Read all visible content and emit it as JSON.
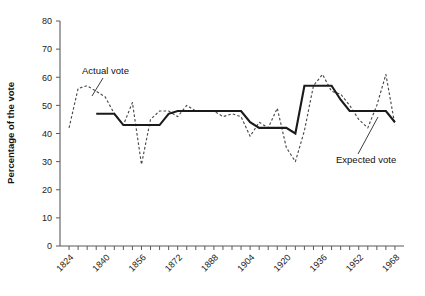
{
  "chart_data": {
    "type": "line",
    "title": "",
    "xlabel": "",
    "ylabel": "Percentage of the vote",
    "ylim": [
      0,
      80
    ],
    "ytick_step": 10,
    "yticks": [
      0,
      10,
      20,
      30,
      40,
      50,
      60,
      70,
      80
    ],
    "ytick_labels": [
      "0",
      "10",
      "20",
      "30",
      "40",
      "50",
      "60",
      "70",
      "80"
    ],
    "xlim": [
      1820,
      1972
    ],
    "xtick_step": 4,
    "xtick_labels": [
      "1824",
      "1840",
      "1856",
      "1872",
      "1888",
      "1904",
      "1920",
      "1936",
      "1952",
      "1968"
    ],
    "xtick_label_years": [
      1824,
      1840,
      1856,
      1872,
      1888,
      1904,
      1920,
      1936,
      1952,
      1968
    ],
    "grid": false,
    "legend_position": "inline-annotation",
    "annotations": [
      {
        "name": "actual-vote",
        "text": "Actual vote",
        "text_x": 82,
        "text_y": 74,
        "leader_from_x": 103,
        "leader_from_y": 78,
        "leader_to_x": 92,
        "leader_to_y": 96
      },
      {
        "name": "expected-vote",
        "text": "Expected vote",
        "text_x": 336,
        "text_y": 163,
        "leader_from_x": 358,
        "leader_from_y": 154,
        "leader_to_x": 378,
        "leader_to_y": 117
      }
    ],
    "series": [
      {
        "name": "Actual vote",
        "style": "dashed",
        "x": [
          1824,
          1828,
          1832,
          1836,
          1840,
          1844,
          1848,
          1852,
          1856,
          1860,
          1864,
          1868,
          1872,
          1876,
          1880,
          1884,
          1888,
          1892,
          1896,
          1900,
          1904,
          1908,
          1912,
          1916,
          1920,
          1924,
          1928,
          1932,
          1936,
          1940,
          1944,
          1948,
          1952,
          1956,
          1960,
          1964,
          1968
        ],
        "values": [
          42,
          56,
          57,
          55,
          53,
          47,
          43,
          51,
          29,
          45,
          48,
          48,
          46,
          50,
          48,
          48,
          48,
          46,
          47,
          46,
          39,
          44,
          42,
          49,
          35,
          30,
          41,
          57,
          61,
          55,
          54,
          50,
          45,
          42,
          50,
          61,
          43
        ]
      },
      {
        "name": "Expected vote",
        "style": "solid",
        "x": [
          1836,
          1840,
          1844,
          1848,
          1852,
          1856,
          1860,
          1864,
          1868,
          1872,
          1876,
          1880,
          1884,
          1888,
          1892,
          1896,
          1900,
          1904,
          1908,
          1912,
          1916,
          1920,
          1924,
          1928,
          1932,
          1936,
          1940,
          1944,
          1948,
          1952,
          1956,
          1960,
          1964,
          1968
        ],
        "values": [
          47,
          47,
          47,
          43,
          43,
          43,
          43,
          43,
          47,
          48,
          48,
          48,
          48,
          48,
          48,
          48,
          48,
          44,
          42,
          42,
          42,
          42,
          40,
          57,
          57,
          57,
          57,
          52,
          48,
          48,
          48,
          48,
          48,
          44
        ]
      }
    ]
  },
  "layout": {
    "plot_left": 60,
    "plot_right": 404,
    "plot_top": 21,
    "plot_bottom": 246
  }
}
